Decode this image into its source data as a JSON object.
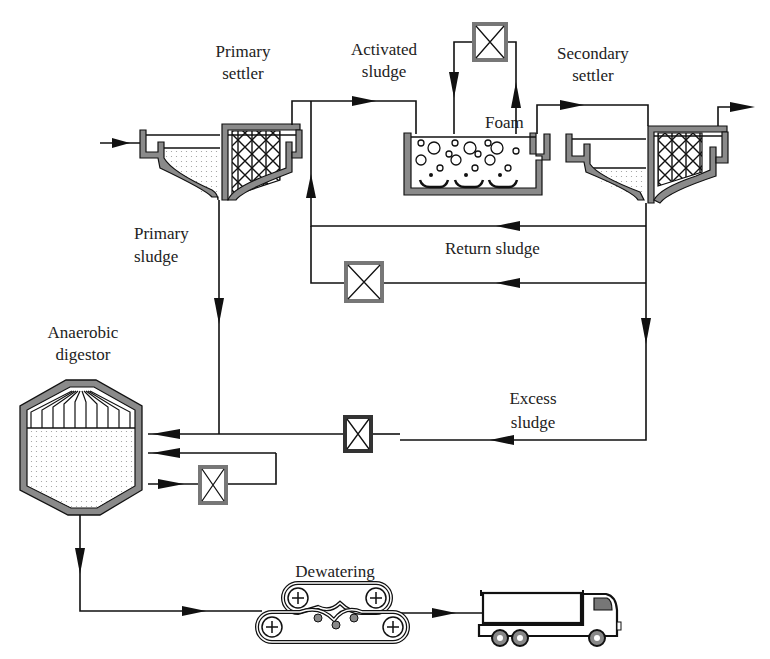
{
  "figure": {
    "type": "wastewater treatment process flow diagram",
    "caption_visible": false
  },
  "labels": {
    "primary_settler": [
      "Primary",
      "settler"
    ],
    "activated_sludge": [
      "Activated",
      "sludge"
    ],
    "secondary_settler": [
      "Secondary",
      "settler"
    ],
    "foam": "Foam",
    "primary_sludge": [
      "Primary",
      "sludge"
    ],
    "return_sludge": "Return sludge",
    "anaerobic_digestor": [
      "Anaerobic",
      "digestor"
    ],
    "excess_sludge": [
      "Excess",
      "sludge"
    ],
    "dewatering": "Dewatering"
  },
  "components": [
    {
      "id": "primary-settler",
      "name": "Primary settler"
    },
    {
      "id": "activated-sludge-tank",
      "name": "Activated sludge"
    },
    {
      "id": "secondary-settler",
      "name": "Secondary settler"
    },
    {
      "id": "anaerobic-digestor",
      "name": "Anaerobic digestor"
    },
    {
      "id": "dewatering-belt-press",
      "name": "Dewatering"
    },
    {
      "id": "sludge-truck",
      "name": "Truck"
    }
  ],
  "pumps": [
    {
      "id": "foam-pump",
      "location": "above activated sludge tank"
    },
    {
      "id": "return-sludge-pump",
      "location": "return sludge line"
    },
    {
      "id": "excess-sludge-pump",
      "location": "excess sludge line"
    },
    {
      "id": "digestor-recirculation-pump",
      "location": "digestor loop"
    }
  ],
  "flows": [
    {
      "from": "influent",
      "to": "primary-settler"
    },
    {
      "from": "primary-settler",
      "to": "activated-sludge-tank"
    },
    {
      "from": "activated-sludge-tank",
      "to": "secondary-settler"
    },
    {
      "from": "secondary-settler",
      "to": "effluent"
    },
    {
      "from": "secondary-settler",
      "to": "activated-sludge-tank",
      "label": "Return sludge"
    },
    {
      "from": "secondary-settler",
      "to": "anaerobic-digestor",
      "label": "Excess sludge"
    },
    {
      "from": "primary-settler",
      "to": "anaerobic-digestor",
      "label": "Primary sludge"
    },
    {
      "from": "anaerobic-digestor",
      "to": "anaerobic-digestor",
      "label": "recirculation"
    },
    {
      "from": "anaerobic-digestor",
      "to": "dewatering-belt-press"
    },
    {
      "from": "dewatering-belt-press",
      "to": "sludge-truck"
    }
  ],
  "colors": {
    "line": "#111111",
    "wall_fill": "#8a8a8a",
    "background": "#ffffff"
  }
}
